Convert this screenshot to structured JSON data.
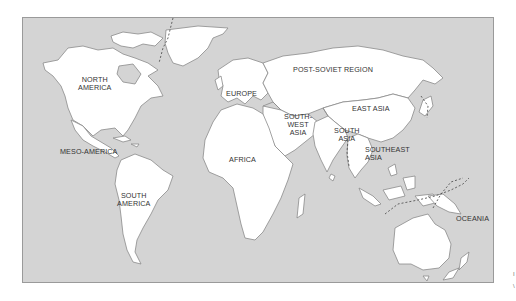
{
  "map": {
    "title": "World regions",
    "background_color": "#d4d4d4",
    "land_color": "#ffffff",
    "regions": [
      {
        "id": "north-america",
        "label": "NORTH\nAMERICA",
        "lines": [
          "NORTH",
          "AMERICA"
        ]
      },
      {
        "id": "meso-america",
        "label": "MESO-AMERICA",
        "lines": [
          "MESO-AMERICA"
        ]
      },
      {
        "id": "south-america",
        "label": "SOUTH\nAMERICA",
        "lines": [
          "SOUTH",
          "AMERICA"
        ]
      },
      {
        "id": "europe",
        "label": "EUROPE",
        "lines": [
          "EUROPE"
        ]
      },
      {
        "id": "post-soviet",
        "label": "POST-SOVIET REGION",
        "lines": [
          "POST-SOVIET REGION"
        ]
      },
      {
        "id": "east-asia",
        "label": "EAST ASIA",
        "lines": [
          "EAST ASIA"
        ]
      },
      {
        "id": "southwest-asia",
        "label": "SOUTH-\nWEST\nASIA",
        "lines": [
          "SOUTH-",
          "WEST",
          "ASIA"
        ]
      },
      {
        "id": "south-asia",
        "label": "SOUTH\nASIA",
        "lines": [
          "SOUTH",
          "ASIA"
        ]
      },
      {
        "id": "southeast-asia",
        "label": "SOUTHEAST\nASIA",
        "lines": [
          "SOUTHEAST",
          "ASIA"
        ]
      },
      {
        "id": "africa",
        "label": "AFRICA",
        "lines": [
          "AFRICA"
        ]
      },
      {
        "id": "oceania",
        "label": "OCEANIA",
        "lines": [
          "OCEANIA"
        ]
      }
    ]
  },
  "edge_marks": [
    "I",
    "\\"
  ]
}
